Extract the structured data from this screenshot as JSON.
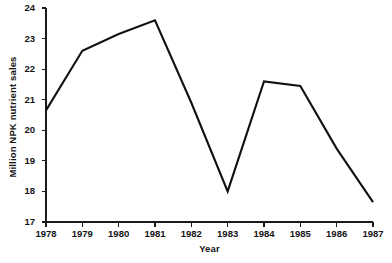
{
  "chart_data": {
    "type": "line",
    "title": "",
    "xlabel": "Year",
    "ylabel": "Million NPK nutrient sales",
    "x": [
      1978,
      1979,
      1980,
      1981,
      1982,
      1983,
      1984,
      1985,
      1986,
      1987
    ],
    "categories": [
      "1978",
      "1979",
      "1980",
      "1981",
      "1982",
      "1983",
      "1984",
      "1985",
      "1986",
      "1987"
    ],
    "values": [
      20.65,
      22.6,
      23.15,
      23.6,
      20.9,
      18.0,
      21.6,
      21.45,
      19.4,
      17.65
    ],
    "series": [
      {
        "name": "Million NPK nutrient sales",
        "values": [
          20.65,
          22.6,
          23.15,
          23.6,
          20.9,
          18.0,
          21.6,
          21.45,
          19.4,
          17.65
        ]
      }
    ],
    "ylim": [
      17,
      24
    ],
    "xlim": [
      1978,
      1987
    ],
    "yticks": [
      17,
      18,
      19,
      20,
      21,
      22,
      23,
      24
    ],
    "yticklabels": [
      "17",
      "18",
      "19",
      "20",
      "21",
      "22",
      "23",
      "24"
    ],
    "xticks": [
      1978,
      1979,
      1980,
      1981,
      1982,
      1983,
      1984,
      1985,
      1986,
      1987
    ],
    "xticklabels": [
      "1978",
      "1979",
      "1980",
      "1981",
      "1982",
      "1983",
      "1984",
      "1985",
      "1986",
      "1987"
    ],
    "grid": false,
    "legend": null,
    "legend_position": "none",
    "line_color": "#111111",
    "axis_color": "#1a1a1a",
    "background_color": "#ffffff",
    "markers": false,
    "annotations": []
  },
  "axes": {
    "y_title": "Million NPK nutrient sales",
    "x_title": "Year"
  }
}
